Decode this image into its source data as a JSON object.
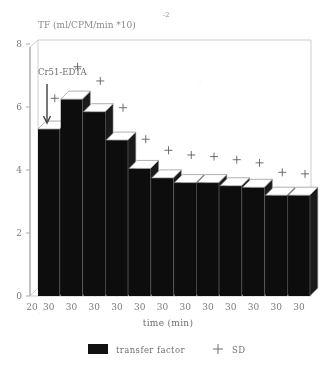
{
  "chart_data": {
    "type": "bar",
    "title": "TF (ml/CPM/min  *10)",
    "title_superscript": "-2",
    "xlabel": "time (min)",
    "ylabel": "",
    "ylim": [
      0,
      8
    ],
    "yticks": [
      0,
      2,
      4,
      6,
      8
    ],
    "ytick_labels": [
      "0",
      "2",
      "4",
      "6",
      "8"
    ],
    "grid": false,
    "origin_tick_label": "20",
    "categories": [
      "30",
      "30",
      "30",
      "30",
      "30",
      "30",
      "30",
      "30",
      "30",
      "30",
      "30",
      "30"
    ],
    "series": [
      {
        "name": "transfer factor",
        "marker": "filled-bar",
        "values": [
          5.3,
          6.25,
          5.85,
          4.95,
          4.05,
          3.75,
          3.6,
          3.6,
          3.5,
          3.45,
          3.2,
          3.2
        ]
      },
      {
        "name": "SD",
        "marker": "plus",
        "values": [
          6.15,
          7.15,
          6.7,
          5.85,
          4.85,
          4.5,
          4.35,
          4.3,
          4.2,
          4.1,
          3.8,
          3.75
        ]
      }
    ],
    "annotations": [
      {
        "text": "Cr51-EDTA",
        "note": "downward arrow marking injection at first time point"
      }
    ],
    "legend": {
      "position": "bottom",
      "entries": [
        {
          "label": "transfer factor",
          "icon": "black-square-swatch"
        },
        {
          "label": "SD",
          "icon": "plus-marker"
        }
      ]
    }
  },
  "colors": {
    "bar_fill": "#0d0d0d",
    "bar_top": "#ffffff",
    "axis": "#a8a8a8",
    "text": "#707070",
    "background": "#ffffff"
  }
}
